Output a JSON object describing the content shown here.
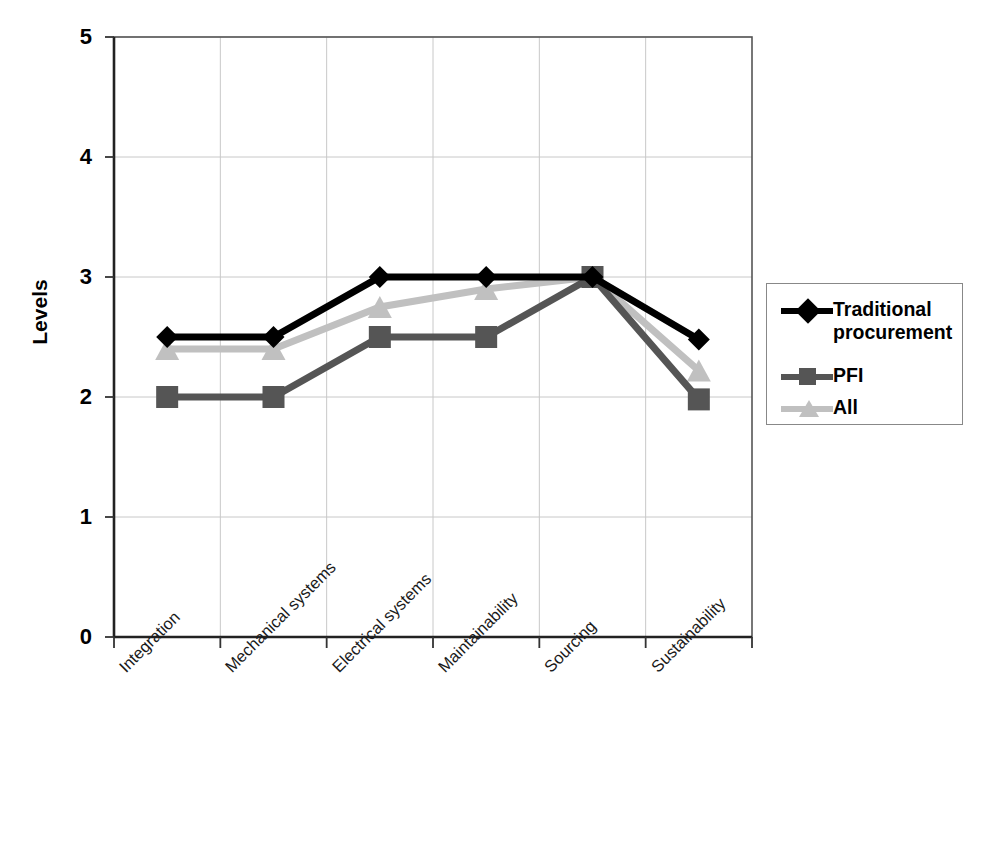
{
  "chart_data": {
    "type": "line",
    "title": "",
    "xlabel": "",
    "ylabel": "Levels",
    "ylim": [
      0,
      5
    ],
    "yticks": [
      "0",
      "1",
      "2",
      "3",
      "4",
      "5"
    ],
    "grid": true,
    "legend_position": "right",
    "categories": [
      "Integration",
      "Mechanical systems",
      "Electrical systems",
      "Maintainability",
      "Sourcing",
      "Sustainability"
    ],
    "series": [
      {
        "name": "Traditional procurement",
        "marker": "diamond",
        "color": "#000000",
        "values": [
          2.5,
          2.5,
          3.0,
          3.0,
          3.0,
          2.48
        ]
      },
      {
        "name": "PFI",
        "marker": "square",
        "color": "#555555",
        "values": [
          2.0,
          2.0,
          2.5,
          2.5,
          3.0,
          1.98
        ]
      },
      {
        "name": "All",
        "marker": "triangle",
        "color": "#c0c0c0",
        "values": [
          2.4,
          2.4,
          2.75,
          2.9,
          3.0,
          2.22
        ]
      }
    ]
  },
  "axes": {
    "y_title": "Levels",
    "y_tick_labels": [
      "5",
      "4",
      "3",
      "2",
      "1",
      "0"
    ],
    "x_tick_labels": [
      "Integration",
      "Mechanical systems",
      "Electrical systems",
      "Maintainability",
      "Sourcing",
      "Sustainability"
    ]
  },
  "legend": {
    "entries": [
      {
        "label": "Traditional procurement",
        "marker": "diamond-icon",
        "color": "#000000"
      },
      {
        "label": "PFI",
        "marker": "square-icon",
        "color": "#555555"
      },
      {
        "label": "All",
        "marker": "triangle-icon",
        "color": "#c0c0c0"
      }
    ]
  },
  "colors": {
    "traditional": "#000000",
    "pfi": "#555555",
    "all": "#c0c0c0",
    "axis": "#333333",
    "grid": "#c8c8c8",
    "background": "#ffffff"
  }
}
